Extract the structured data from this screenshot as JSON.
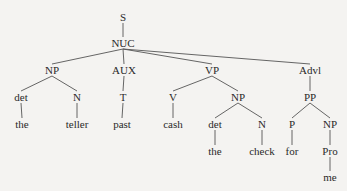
{
  "diagram": {
    "type": "syntax-tree",
    "line_color": "#555555",
    "nodes": [
      {
        "id": "S",
        "label": "S",
        "x": 123,
        "y": 17
      },
      {
        "id": "NUC",
        "label": "NUC",
        "x": 123,
        "y": 43
      },
      {
        "id": "NP1",
        "label": "NP",
        "x": 52,
        "y": 70
      },
      {
        "id": "AUX",
        "label": "AUX",
        "x": 124,
        "y": 70
      },
      {
        "id": "VP",
        "label": "VP",
        "x": 212,
        "y": 70
      },
      {
        "id": "Advl",
        "label": "Advl",
        "x": 310,
        "y": 70
      },
      {
        "id": "det1",
        "label": "det",
        "x": 21,
        "y": 97
      },
      {
        "id": "N1",
        "label": "N",
        "x": 77,
        "y": 97
      },
      {
        "id": "T",
        "label": "T",
        "x": 123,
        "y": 97
      },
      {
        "id": "V",
        "label": "V",
        "x": 173,
        "y": 97
      },
      {
        "id": "NP2",
        "label": "NP",
        "x": 238,
        "y": 97
      },
      {
        "id": "PP",
        "label": "PP",
        "x": 310,
        "y": 97
      },
      {
        "id": "the1",
        "label": "the",
        "x": 22,
        "y": 124
      },
      {
        "id": "teller",
        "label": "teller",
        "x": 77,
        "y": 124
      },
      {
        "id": "past",
        "label": "past",
        "x": 122,
        "y": 124
      },
      {
        "id": "cash",
        "label": "cash",
        "x": 173,
        "y": 124
      },
      {
        "id": "det2",
        "label": "det",
        "x": 215,
        "y": 124
      },
      {
        "id": "N2",
        "label": "N",
        "x": 262,
        "y": 124
      },
      {
        "id": "P",
        "label": "P",
        "x": 292,
        "y": 124
      },
      {
        "id": "NP3",
        "label": "NP",
        "x": 330,
        "y": 124
      },
      {
        "id": "the2",
        "label": "the",
        "x": 215,
        "y": 151
      },
      {
        "id": "check",
        "label": "check",
        "x": 262,
        "y": 151
      },
      {
        "id": "for",
        "label": "for",
        "x": 292,
        "y": 151
      },
      {
        "id": "Pro",
        "label": "Pro",
        "x": 330,
        "y": 151
      },
      {
        "id": "me",
        "label": "me",
        "x": 330,
        "y": 177
      }
    ],
    "edges": [
      [
        "S",
        "NUC"
      ],
      [
        "NUC",
        "NP1"
      ],
      [
        "NUC",
        "AUX"
      ],
      [
        "NUC",
        "VP"
      ],
      [
        "NUC",
        "Advl"
      ],
      [
        "NP1",
        "det1"
      ],
      [
        "NP1",
        "N1"
      ],
      [
        "AUX",
        "T"
      ],
      [
        "VP",
        "V"
      ],
      [
        "VP",
        "NP2"
      ],
      [
        "Advl",
        "PP"
      ],
      [
        "det1",
        "the1"
      ],
      [
        "N1",
        "teller"
      ],
      [
        "T",
        "past"
      ],
      [
        "V",
        "cash"
      ],
      [
        "NP2",
        "det2"
      ],
      [
        "NP2",
        "N2"
      ],
      [
        "PP",
        "P"
      ],
      [
        "PP",
        "NP3"
      ],
      [
        "det2",
        "the2"
      ],
      [
        "N2",
        "check"
      ],
      [
        "P",
        "for"
      ],
      [
        "NP3",
        "Pro"
      ],
      [
        "Pro",
        "me"
      ]
    ]
  }
}
